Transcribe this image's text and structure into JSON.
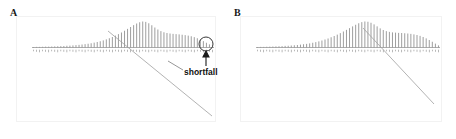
{
  "figure": {
    "background": "#ffffff",
    "width": 456,
    "height": 139
  },
  "panels": [
    {
      "id": "A",
      "label": "A",
      "annotation": {
        "label": "shortfall",
        "marker": "circle",
        "pointer": "up-arrow"
      }
    },
    {
      "id": "B",
      "label": "B",
      "annotation": null
    }
  ],
  "colors": {
    "bar": "#8c8c8c",
    "line": "#9a9a9a",
    "axis": "#7a7a7a",
    "frame": "#f2f2f2",
    "text": "#111111",
    "annotation": "#333333"
  },
  "chart_data": [
    {
      "type": "bar",
      "title": "A",
      "xlabel": "",
      "ylabel": "",
      "grid": false,
      "legend": null,
      "axis_range_x": [
        0,
        60
      ],
      "ylim": [
        0,
        22
      ],
      "tick_labels_legible": false,
      "categories": [
        "1",
        "2",
        "3",
        "4",
        "5",
        "6",
        "7",
        "8",
        "9",
        "10",
        "11",
        "12",
        "13",
        "14",
        "15",
        "16",
        "17",
        "18",
        "19",
        "20",
        "21",
        "22",
        "23",
        "24",
        "25",
        "26",
        "27",
        "28",
        "29",
        "30",
        "31",
        "32",
        "33",
        "34",
        "35",
        "36",
        "37",
        "38",
        "39",
        "40",
        "41",
        "42",
        "43",
        "44",
        "45",
        "46",
        "47",
        "48",
        "49",
        "50",
        "51",
        "52",
        "53",
        "54",
        "55",
        "56",
        "57",
        "58",
        "59",
        "60"
      ],
      "values": [
        0.4,
        0.5,
        0.5,
        0.6,
        0.7,
        0.7,
        0.8,
        0.9,
        1.0,
        1.1,
        1.2,
        1.4,
        1.5,
        1.7,
        1.9,
        2.1,
        2.4,
        2.7,
        3.0,
        3.4,
        3.9,
        4.4,
        5.0,
        5.7,
        6.5,
        7.4,
        8.4,
        9.5,
        10.7,
        12.0,
        13.4,
        14.9,
        16.4,
        17.9,
        19.2,
        20.2,
        20.8,
        20.5,
        19.4,
        17.8,
        16.0,
        14.4,
        13.1,
        12.2,
        11.6,
        11.2,
        10.9,
        10.7,
        10.5,
        10.2,
        9.9,
        9.5,
        9.0,
        8.3,
        7.4,
        6.3,
        5.1,
        3.8,
        2.5,
        1.4
      ],
      "overlay_line": {
        "name": "capacity",
        "description": "descending diagonal line crossing the distribution",
        "x": [
          24,
          60
        ],
        "y_start_px": 40,
        "points": [
          [
            24,
            11.5
          ],
          [
            60,
            -30
          ]
        ]
      },
      "annotations": [
        {
          "type": "circle",
          "label": "shortfall",
          "center_x": 56,
          "center_y": 1.5
        },
        {
          "type": "arrow",
          "direction": "up",
          "label": "shortfall"
        }
      ]
    },
    {
      "type": "bar",
      "title": "B",
      "xlabel": "",
      "ylabel": "",
      "grid": false,
      "legend": null,
      "axis_range_x": [
        0,
        60
      ],
      "ylim": [
        0,
        22
      ],
      "tick_labels_legible": false,
      "categories": [
        "1",
        "2",
        "3",
        "4",
        "5",
        "6",
        "7",
        "8",
        "9",
        "10",
        "11",
        "12",
        "13",
        "14",
        "15",
        "16",
        "17",
        "18",
        "19",
        "20",
        "21",
        "22",
        "23",
        "24",
        "25",
        "26",
        "27",
        "28",
        "29",
        "30",
        "31",
        "32",
        "33",
        "34",
        "35",
        "36",
        "37",
        "38",
        "39",
        "40",
        "41",
        "42",
        "43",
        "44",
        "45",
        "46",
        "47",
        "48",
        "49",
        "50",
        "51",
        "52",
        "53",
        "54",
        "55",
        "56",
        "57",
        "58",
        "59",
        "60"
      ],
      "values": [
        0.4,
        0.5,
        0.5,
        0.6,
        0.7,
        0.8,
        0.9,
        1.0,
        1.1,
        1.3,
        1.4,
        1.6,
        1.8,
        2.0,
        2.3,
        2.6,
        2.9,
        3.3,
        3.8,
        4.3,
        4.9,
        5.6,
        6.4,
        7.2,
        8.2,
        9.2,
        10.3,
        11.5,
        12.8,
        14.1,
        15.5,
        16.9,
        18.2,
        19.4,
        20.3,
        20.8,
        20.6,
        19.8,
        18.5,
        16.9,
        15.3,
        14.0,
        13.1,
        12.5,
        12.1,
        11.9,
        11.7,
        11.6,
        11.4,
        11.2,
        10.9,
        10.5,
        10.0,
        9.3,
        8.4,
        7.3,
        6.0,
        4.6,
        3.1,
        1.7
      ],
      "overlay_line": {
        "name": "capacity",
        "description": "descending diagonal line crossing the distribution",
        "x": [
          40,
          60
        ],
        "points": [
          [
            40,
            13.5
          ],
          [
            60,
            -28
          ]
        ]
      },
      "annotations": []
    }
  ]
}
